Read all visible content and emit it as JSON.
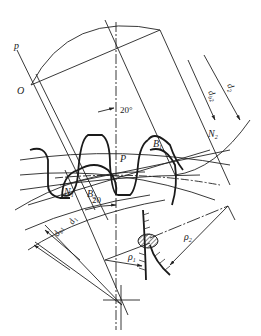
{
  "diagram": {
    "colors": {
      "line": "#222222",
      "background": "#ffffff",
      "hatch": "#333333"
    },
    "labels": {
      "p_line": "p",
      "origin": "O",
      "pitch_point": "P",
      "angle_top": "20°",
      "angle_bottom": "20",
      "B1": "B",
      "B1_sub": "1",
      "B2": "B",
      "B2_sub": "2",
      "N1": "N",
      "N1_sub": "1",
      "N2": "N",
      "N2_sub": "2",
      "db2": "d",
      "db2_sub": "b2",
      "d2": "d",
      "d2_sub": "2",
      "db1": "d",
      "db1_sub": "b1",
      "d1": "d",
      "d1_sub": "1",
      "rho1": "ρ",
      "rho1_sub": "1",
      "rho2": "ρ",
      "rho2_sub": "2"
    }
  }
}
